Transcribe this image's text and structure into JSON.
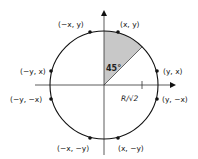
{
  "diagram": {
    "type": "unit-circle-symmetry",
    "center": [
      104,
      85
    ],
    "radius": 54,
    "angle_label": "45°",
    "radius_tick_label": "R/√2",
    "colors": {
      "stroke": "#111111",
      "sector_fill": "#c8c8c8",
      "axis": "#333333"
    },
    "points": [
      {
        "label": "(x, y)",
        "x": 118,
        "y": 31
      },
      {
        "label": "(−x, y)",
        "x": 90,
        "y": 31
      },
      {
        "label": "(y, x)",
        "x": 157,
        "y": 71
      },
      {
        "label": "(−y, x)",
        "x": 51,
        "y": 71
      },
      {
        "label": "(y, −x)",
        "x": 157,
        "y": 99
      },
      {
        "label": "(−y, −x)",
        "x": 51,
        "y": 99
      },
      {
        "label": "(x, −y)",
        "x": 118,
        "y": 139
      },
      {
        "label": "(−x, −y)",
        "x": 90,
        "y": 139
      }
    ]
  }
}
